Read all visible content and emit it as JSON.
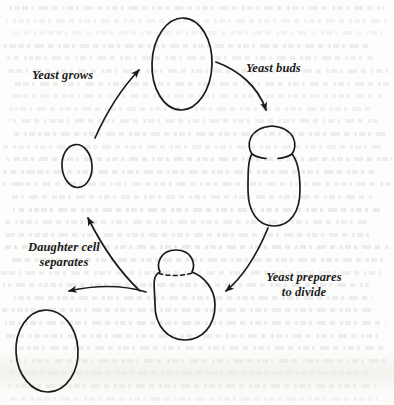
{
  "figure": {
    "stroke_color": "#1b1b1b",
    "background_color": "#fdfdfc",
    "text_color": "#1a1a1a"
  },
  "labels": [
    {
      "id": "yeast-grows",
      "text": "Yeast grows",
      "x": 32,
      "y": 68,
      "align": "left",
      "width": 92
    },
    {
      "id": "yeast-buds",
      "text": "Yeast buds",
      "x": 246,
      "y": 61,
      "align": "left",
      "width": 86
    },
    {
      "id": "daughter-cell",
      "text": "Daughter cell\nseparates",
      "x": 16,
      "y": 240,
      "align": "center",
      "width": 96
    },
    {
      "id": "yeast-prepares",
      "text": "Yeast prepares\nto divide",
      "x": 253,
      "y": 270,
      "align": "center",
      "width": 100
    }
  ],
  "cells": [
    {
      "id": "small-daughter-cell",
      "stage": "newly separated daughter cell",
      "cx": 77,
      "cy": 166,
      "rx": 15,
      "ry": 21
    },
    {
      "id": "grown-mother-cell",
      "stage": "grown mother cell",
      "cx": 182,
      "cy": 64,
      "rx": 30,
      "ry": 46
    },
    {
      "id": "budding-cell-body",
      "stage": "budding cell body",
      "cx": 274,
      "cy": 190,
      "rx": 26,
      "ry": 35
    },
    {
      "id": "budding-cell-bud",
      "stage": "emerging bud",
      "cx": 272,
      "cy": 143,
      "rx": 20,
      "ry": 18
    },
    {
      "id": "dividing-cell-body",
      "stage": "cell preparing to divide",
      "cx": 185,
      "cy": 305,
      "rx": 30,
      "ry": 35
    },
    {
      "id": "dividing-cell-bud",
      "stage": "mature bud before separation",
      "cx": 176,
      "cy": 266,
      "rx": 16,
      "ry": 16
    },
    {
      "id": "separated-cell",
      "stage": "separated daughter cell",
      "cx": 47,
      "cy": 351,
      "rx": 31,
      "ry": 41
    }
  ],
  "septum": {
    "id": "division-septum",
    "style": "dashed",
    "x1": 158,
    "y1": 274,
    "x2": 196,
    "y2": 272
  },
  "arrows": [
    {
      "id": "arrow-yeast-grows",
      "label": "Yeast grows",
      "from": "small-daughter-cell",
      "to": "grown-mother-cell",
      "direction": "up-right"
    },
    {
      "id": "arrow-yeast-buds",
      "label": "Yeast buds",
      "from": "grown-mother-cell",
      "to": "budding-cell-bud",
      "direction": "down-right"
    },
    {
      "id": "arrow-yeast-prepares",
      "label": "Yeast prepares to divide",
      "from": "budding-cell-body",
      "to": "dividing-cell-body",
      "direction": "down-left"
    },
    {
      "id": "arrow-daughter-separates",
      "label": "Daughter cell separates",
      "from": "dividing-cell-bud",
      "to": "separated-cell",
      "direction": "left-down"
    },
    {
      "id": "arrow-cycle-return",
      "label": "",
      "from": "dividing-cell-bud",
      "to": "small-daughter-cell",
      "direction": "up-left"
    }
  ]
}
